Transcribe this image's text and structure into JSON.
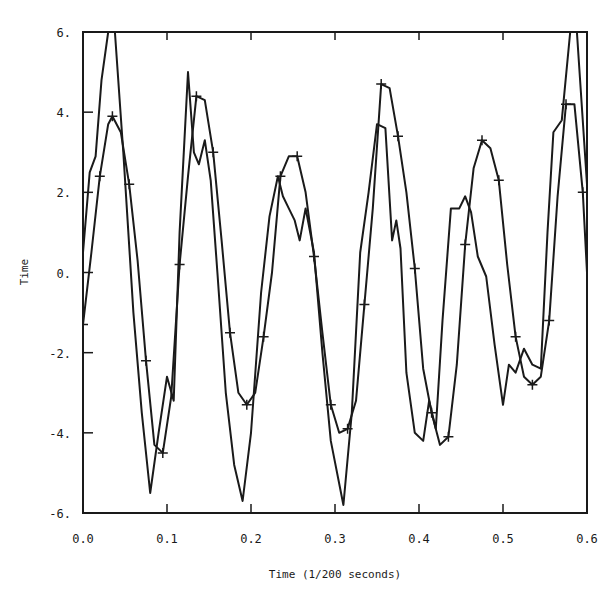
{
  "chart_data": {
    "type": "line",
    "title": "",
    "xlabel": "Time (1/200 seconds)",
    "ylabel": "Time",
    "xlim": [
      0.0,
      0.6
    ],
    "ylim": [
      -6,
      6
    ],
    "grid": false,
    "legend": null,
    "x_ticks": [
      "0.0",
      "0.1",
      "0.2",
      "0.3",
      "0.4",
      "0.5",
      "0.6"
    ],
    "y_ticks": [
      "6.",
      "4.",
      "2.",
      "0.",
      "-2.",
      "-4.",
      "-6."
    ],
    "series": [
      {
        "name": "smooth fit (+ markers)",
        "marker": "+",
        "x": [
          0.0,
          0.01,
          0.02,
          0.03,
          0.035,
          0.045,
          0.055,
          0.065,
          0.075,
          0.085,
          0.095,
          0.105,
          0.115,
          0.125,
          0.135,
          0.145,
          0.155,
          0.165,
          0.175,
          0.185,
          0.195,
          0.205,
          0.215,
          0.225,
          0.235,
          0.245,
          0.255,
          0.265,
          0.275,
          0.285,
          0.295,
          0.305,
          0.315,
          0.325,
          0.335,
          0.345,
          0.355,
          0.365,
          0.375,
          0.385,
          0.395,
          0.405,
          0.415,
          0.425,
          0.435,
          0.445,
          0.455,
          0.465,
          0.475,
          0.485,
          0.495,
          0.505,
          0.515,
          0.525,
          0.535,
          0.545,
          0.555,
          0.565,
          0.575,
          0.585,
          0.595,
          0.6
        ],
        "y": [
          -1.3,
          0.5,
          2.4,
          3.7,
          3.9,
          3.5,
          2.2,
          0.3,
          -2.2,
          -4.3,
          -4.5,
          -3.1,
          0.2,
          2.4,
          4.4,
          4.3,
          3.0,
          0.8,
          -1.5,
          -3.0,
          -3.3,
          -3.0,
          -1.6,
          0.0,
          2.4,
          2.9,
          2.9,
          2.0,
          0.4,
          -1.5,
          -3.3,
          -4.0,
          -3.9,
          -3.2,
          -0.8,
          1.6,
          4.7,
          4.6,
          3.4,
          2.0,
          0.1,
          -2.4,
          -3.5,
          -4.3,
          -4.1,
          -2.3,
          0.7,
          2.6,
          3.3,
          3.1,
          2.3,
          0.2,
          -1.6,
          -2.6,
          -2.8,
          -2.6,
          -1.2,
          1.9,
          4.2,
          4.2,
          2.0,
          0.0
        ]
      },
      {
        "name": "raw signal",
        "marker": null,
        "x": [
          0.0,
          0.008,
          0.015,
          0.022,
          0.03,
          0.038,
          0.048,
          0.06,
          0.07,
          0.08,
          0.09,
          0.1,
          0.108,
          0.115,
          0.125,
          0.132,
          0.138,
          0.145,
          0.152,
          0.16,
          0.17,
          0.18,
          0.19,
          0.2,
          0.212,
          0.222,
          0.232,
          0.238,
          0.245,
          0.252,
          0.258,
          0.265,
          0.275,
          0.285,
          0.295,
          0.31,
          0.32,
          0.33,
          0.34,
          0.35,
          0.36,
          0.368,
          0.373,
          0.378,
          0.385,
          0.395,
          0.405,
          0.412,
          0.42,
          0.428,
          0.438,
          0.448,
          0.455,
          0.462,
          0.47,
          0.48,
          0.49,
          0.5,
          0.507,
          0.515,
          0.525,
          0.535,
          0.545,
          0.553,
          0.56,
          0.57,
          0.58,
          0.588,
          0.6
        ],
        "y": [
          0.5,
          2.5,
          2.9,
          4.8,
          6.0,
          6.0,
          3.0,
          -1.0,
          -3.5,
          -5.5,
          -4.0,
          -2.6,
          -3.2,
          1.0,
          5.0,
          3.0,
          2.7,
          3.3,
          2.3,
          0.0,
          -3.0,
          -4.8,
          -5.7,
          -4.0,
          -0.5,
          1.4,
          2.4,
          1.9,
          1.6,
          1.3,
          0.8,
          1.6,
          0.5,
          -2.0,
          -4.2,
          -5.8,
          -3.5,
          0.5,
          2.0,
          3.7,
          3.6,
          0.8,
          1.3,
          0.6,
          -2.5,
          -4.0,
          -4.2,
          -3.2,
          -3.9,
          -1.2,
          1.6,
          1.6,
          1.9,
          1.5,
          0.4,
          -0.1,
          -1.8,
          -3.3,
          -2.3,
          -2.5,
          -1.9,
          -2.3,
          -2.4,
          1.0,
          3.5,
          3.8,
          6.0,
          6.0,
          2.2
        ]
      }
    ]
  }
}
